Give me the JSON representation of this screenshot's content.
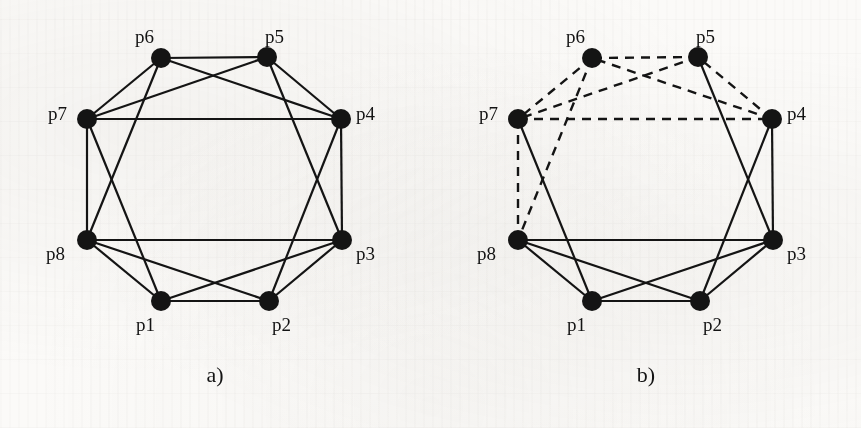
{
  "figure": {
    "background_color": "#fbfaf8",
    "ink_color": "#141414",
    "panels": [
      {
        "id": "a",
        "caption": "a)",
        "node_labels": {
          "p1": "p1",
          "p2": "p2",
          "p3": "p3",
          "p4": "p4",
          "p5": "p5",
          "p6": "p6",
          "p7": "p7",
          "p8": "p8"
        }
      },
      {
        "id": "b",
        "caption": "b)",
        "node_labels": {
          "p1": "p1",
          "p2": "p2",
          "p3": "p3",
          "p4": "p4",
          "p5": "p5",
          "p6": "p6",
          "p7": "p7",
          "p8": "p8"
        }
      }
    ]
  },
  "chart_data": {
    "type": "diagram",
    "subtype": "graph",
    "title": "",
    "panels": [
      {
        "id": "a",
        "caption": "a)",
        "node_count": 8,
        "edge_count": 18,
        "nodes": [
          {
            "id": "p1",
            "label": "p1",
            "x": 161,
            "y": 301,
            "r": 10,
            "label_x": 136,
            "label_y": 315
          },
          {
            "id": "p2",
            "label": "p2",
            "x": 269,
            "y": 301,
            "r": 10,
            "label_x": 272,
            "label_y": 315
          },
          {
            "id": "p3",
            "label": "p3",
            "x": 342,
            "y": 240,
            "r": 10,
            "label_x": 356,
            "label_y": 244
          },
          {
            "id": "p4",
            "label": "p4",
            "x": 341,
            "y": 119,
            "r": 10,
            "label_x": 356,
            "label_y": 104
          },
          {
            "id": "p5",
            "label": "p5",
            "x": 267,
            "y": 57,
            "r": 10,
            "label_x": 265,
            "label_y": 27
          },
          {
            "id": "p6",
            "label": "p6",
            "x": 161,
            "y": 58,
            "r": 10,
            "label_x": 135,
            "label_y": 27
          },
          {
            "id": "p7",
            "label": "p7",
            "x": 87,
            "y": 119,
            "r": 10,
            "label_x": 48,
            "label_y": 104
          },
          {
            "id": "p8",
            "label": "p8",
            "x": 87,
            "y": 240,
            "r": 10,
            "label_x": 46,
            "label_y": 244
          }
        ],
        "edges": [
          {
            "from": "p1",
            "to": "p2",
            "style": "solid"
          },
          {
            "from": "p2",
            "to": "p3",
            "style": "solid"
          },
          {
            "from": "p3",
            "to": "p4",
            "style": "solid"
          },
          {
            "from": "p4",
            "to": "p5",
            "style": "solid"
          },
          {
            "from": "p5",
            "to": "p6",
            "style": "solid"
          },
          {
            "from": "p6",
            "to": "p7",
            "style": "solid"
          },
          {
            "from": "p7",
            "to": "p8",
            "style": "solid"
          },
          {
            "from": "p8",
            "to": "p1",
            "style": "solid"
          },
          {
            "from": "p1",
            "to": "p3",
            "style": "solid"
          },
          {
            "from": "p2",
            "to": "p4",
            "style": "solid"
          },
          {
            "from": "p3",
            "to": "p5",
            "style": "solid"
          },
          {
            "from": "p4",
            "to": "p6",
            "style": "solid"
          },
          {
            "from": "p5",
            "to": "p7",
            "style": "solid"
          },
          {
            "from": "p6",
            "to": "p8",
            "style": "solid"
          },
          {
            "from": "p7",
            "to": "p1",
            "style": "solid"
          },
          {
            "from": "p8",
            "to": "p2",
            "style": "solid"
          },
          {
            "from": "p7",
            "to": "p4",
            "style": "solid"
          },
          {
            "from": "p8",
            "to": "p3",
            "style": "solid"
          }
        ]
      },
      {
        "id": "b",
        "caption": "b)",
        "node_count": 8,
        "edge_count": 18,
        "nodes": [
          {
            "id": "p1",
            "label": "p1",
            "x": 161,
            "y": 301,
            "r": 10,
            "label_x": 136,
            "label_y": 315
          },
          {
            "id": "p2",
            "label": "p2",
            "x": 269,
            "y": 301,
            "r": 10,
            "label_x": 272,
            "label_y": 315
          },
          {
            "id": "p3",
            "label": "p3",
            "x": 342,
            "y": 240,
            "r": 10,
            "label_x": 356,
            "label_y": 244
          },
          {
            "id": "p4",
            "label": "p4",
            "x": 341,
            "y": 119,
            "r": 10,
            "label_x": 356,
            "label_y": 104
          },
          {
            "id": "p5",
            "label": "p5",
            "x": 267,
            "y": 57,
            "r": 10,
            "label_x": 265,
            "label_y": 27
          },
          {
            "id": "p6",
            "label": "p6",
            "x": 161,
            "y": 58,
            "r": 10,
            "label_x": 135,
            "label_y": 27
          },
          {
            "id": "p7",
            "label": "p7",
            "x": 87,
            "y": 119,
            "r": 10,
            "label_x": 48,
            "label_y": 104
          },
          {
            "id": "p8",
            "label": "p8",
            "x": 87,
            "y": 240,
            "r": 10,
            "label_x": 46,
            "label_y": 244
          }
        ],
        "edges": [
          {
            "from": "p1",
            "to": "p2",
            "style": "solid"
          },
          {
            "from": "p2",
            "to": "p3",
            "style": "solid"
          },
          {
            "from": "p3",
            "to": "p4",
            "style": "solid"
          },
          {
            "from": "p4",
            "to": "p5",
            "style": "dashed"
          },
          {
            "from": "p5",
            "to": "p6",
            "style": "dashed"
          },
          {
            "from": "p6",
            "to": "p7",
            "style": "dashed"
          },
          {
            "from": "p7",
            "to": "p8",
            "style": "dashed"
          },
          {
            "from": "p8",
            "to": "p1",
            "style": "solid"
          },
          {
            "from": "p1",
            "to": "p3",
            "style": "solid"
          },
          {
            "from": "p2",
            "to": "p4",
            "style": "solid"
          },
          {
            "from": "p3",
            "to": "p5",
            "style": "solid"
          },
          {
            "from": "p4",
            "to": "p6",
            "style": "dashed"
          },
          {
            "from": "p5",
            "to": "p7",
            "style": "dashed"
          },
          {
            "from": "p6",
            "to": "p8",
            "style": "dashed"
          },
          {
            "from": "p7",
            "to": "p1",
            "style": "solid"
          },
          {
            "from": "p8",
            "to": "p2",
            "style": "solid"
          },
          {
            "from": "p7",
            "to": "p4",
            "style": "dashed"
          },
          {
            "from": "p8",
            "to": "p3",
            "style": "solid"
          }
        ]
      }
    ],
    "legend": [
      {
        "style": "solid",
        "name": "solid-edge"
      },
      {
        "style": "dashed",
        "name": "dashed-edge"
      }
    ]
  }
}
